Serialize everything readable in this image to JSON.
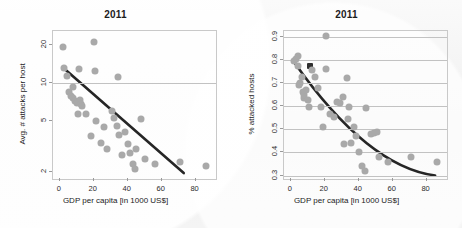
{
  "figure": {
    "background_color": "#f2f2f2",
    "point_color": "#a9a9a9",
    "trend_color": "#262626",
    "grid_color": "#c2c2c2"
  },
  "chart_data": [
    {
      "type": "scatter",
      "panel": "left",
      "title": "2011",
      "xlabel": "GDP per capita [in 1000 US$]",
      "ylabel": "Avg. # attacks per host",
      "xlim": [
        -4,
        92
      ],
      "ylim": [
        1.75,
        26
      ],
      "yscale": "log",
      "xticks": [
        0,
        20,
        40,
        60,
        80
      ],
      "xticklabels": [
        "0",
        "20",
        "40",
        "60",
        "80"
      ],
      "yticks": [
        2,
        5,
        10,
        20
      ],
      "yticklabels": [
        "2",
        "5",
        "10",
        "20"
      ],
      "grid": "horizontal-at-10",
      "gridlines_y": [
        10
      ],
      "legend": "none",
      "points": [
        {
          "x": 2.0,
          "y": 19.6
        },
        {
          "x": 2.5,
          "y": 13.2
        },
        {
          "x": 4.5,
          "y": 11.5
        },
        {
          "x": 5.5,
          "y": 8.6
        },
        {
          "x": 6.5,
          "y": 8.0
        },
        {
          "x": 7.5,
          "y": 7.6
        },
        {
          "x": 8.0,
          "y": 9.3
        },
        {
          "x": 9.0,
          "y": 7.3
        },
        {
          "x": 10.0,
          "y": 7.0
        },
        {
          "x": 10.5,
          "y": 5.7
        },
        {
          "x": 11.5,
          "y": 13.0
        },
        {
          "x": 12.0,
          "y": 7.4
        },
        {
          "x": 12.5,
          "y": 6.9
        },
        {
          "x": 13.0,
          "y": 6.6
        },
        {
          "x": 15.5,
          "y": 5.7
        },
        {
          "x": 18.5,
          "y": 3.8
        },
        {
          "x": 20.0,
          "y": 21.4
        },
        {
          "x": 20.5,
          "y": 12.6
        },
        {
          "x": 21.5,
          "y": 5.0
        },
        {
          "x": 24.0,
          "y": 3.4
        },
        {
          "x": 26.0,
          "y": 4.5
        },
        {
          "x": 28.0,
          "y": 3.0
        },
        {
          "x": 31.0,
          "y": 6.0
        },
        {
          "x": 32.0,
          "y": 5.3
        },
        {
          "x": 33.5,
          "y": 4.6
        },
        {
          "x": 34.0,
          "y": 11.2
        },
        {
          "x": 35.0,
          "y": 3.9
        },
        {
          "x": 36.5,
          "y": 2.7
        },
        {
          "x": 38.5,
          "y": 4.1
        },
        {
          "x": 40.0,
          "y": 3.3
        },
        {
          "x": 41.5,
          "y": 2.8
        },
        {
          "x": 43.0,
          "y": 2.3
        },
        {
          "x": 44.0,
          "y": 2.1
        },
        {
          "x": 45.0,
          "y": 3.0
        },
        {
          "x": 48.0,
          "y": 5.2
        },
        {
          "x": 50.0,
          "y": 2.5
        },
        {
          "x": 56.0,
          "y": 2.3
        },
        {
          "x": 71.0,
          "y": 2.4
        },
        {
          "x": 86.0,
          "y": 2.2
        }
      ],
      "trendline": {
        "shape": "straight",
        "start": {
          "x": 2.0,
          "y": 13.3
        },
        "end": {
          "x": 73.0,
          "y": 1.95
        }
      }
    },
    {
      "type": "scatter",
      "panel": "right",
      "title": "2011",
      "xlabel": "GDP per capita [in 1000 US$]",
      "ylabel": "% attacked hosts",
      "xlim": [
        -4,
        92
      ],
      "ylim": [
        0.285,
        0.925
      ],
      "yscale": "linear",
      "xticks": [
        0,
        20,
        40,
        60,
        80
      ],
      "xticklabels": [
        "0",
        "20",
        "40",
        "60",
        "80"
      ],
      "yticks": [
        0.3,
        0.4,
        0.5,
        0.6,
        0.7,
        0.8,
        0.9
      ],
      "yticklabels": [
        "0.3",
        "0.4",
        "0.5",
        "0.6",
        "0.7",
        "0.8",
        "0.9"
      ],
      "grid": "horizontal-all-ticks",
      "gridlines_y": [
        0.3,
        0.4,
        0.5,
        0.6,
        0.7,
        0.8,
        0.9
      ],
      "legend": "none",
      "points": [
        {
          "x": 2.0,
          "y": 0.795
        },
        {
          "x": 3.0,
          "y": 0.805
        },
        {
          "x": 4.0,
          "y": 0.815
        },
        {
          "x": 4.5,
          "y": 0.775
        },
        {
          "x": 5.0,
          "y": 0.69
        },
        {
          "x": 5.5,
          "y": 0.7
        },
        {
          "x": 6.5,
          "y": 0.725
        },
        {
          "x": 7.0,
          "y": 0.66
        },
        {
          "x": 7.5,
          "y": 0.635
        },
        {
          "x": 8.0,
          "y": 0.65
        },
        {
          "x": 9.0,
          "y": 0.67
        },
        {
          "x": 10.0,
          "y": 0.625
        },
        {
          "x": 11.0,
          "y": 0.595
        },
        {
          "x": 11.5,
          "y": 0.775,
          "marker": "cursor"
        },
        {
          "x": 12.5,
          "y": 0.755
        },
        {
          "x": 14.5,
          "y": 0.725
        },
        {
          "x": 16.0,
          "y": 0.68
        },
        {
          "x": 17.5,
          "y": 0.595
        },
        {
          "x": 19.0,
          "y": 0.51
        },
        {
          "x": 20.5,
          "y": 0.905
        },
        {
          "x": 21.0,
          "y": 0.76
        },
        {
          "x": 23.0,
          "y": 0.565
        },
        {
          "x": 25.5,
          "y": 0.555
        },
        {
          "x": 27.5,
          "y": 0.62
        },
        {
          "x": 29.0,
          "y": 0.615
        },
        {
          "x": 30.5,
          "y": 0.64
        },
        {
          "x": 31.5,
          "y": 0.435
        },
        {
          "x": 33.0,
          "y": 0.72
        },
        {
          "x": 33.5,
          "y": 0.545
        },
        {
          "x": 34.5,
          "y": 0.595
        },
        {
          "x": 35.5,
          "y": 0.44
        },
        {
          "x": 37.0,
          "y": 0.51
        },
        {
          "x": 38.5,
          "y": 0.47
        },
        {
          "x": 40.0,
          "y": 0.4
        },
        {
          "x": 42.0,
          "y": 0.34
        },
        {
          "x": 43.5,
          "y": 0.32
        },
        {
          "x": 44.5,
          "y": 0.59
        },
        {
          "x": 47.0,
          "y": 0.48
        },
        {
          "x": 49.0,
          "y": 0.485
        },
        {
          "x": 50.5,
          "y": 0.49
        },
        {
          "x": 52.0,
          "y": 0.38
        },
        {
          "x": 57.0,
          "y": 0.36
        },
        {
          "x": 71.0,
          "y": 0.38
        },
        {
          "x": 86.0,
          "y": 0.36
        }
      ],
      "trendline": {
        "shape": "curved-convex",
        "start": {
          "x": 2.0,
          "y": 0.79
        },
        "end": {
          "x": 85.0,
          "y": 0.3
        }
      }
    }
  ]
}
